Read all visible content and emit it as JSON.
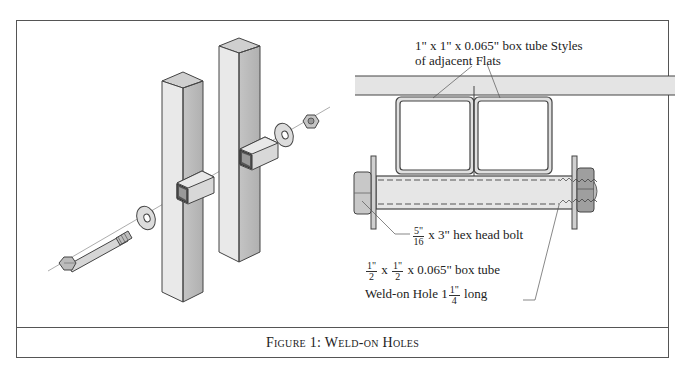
{
  "figure": {
    "caption": "Figure 1:  Weld-on Holes"
  },
  "left_illustration": {
    "description": "Exploded isometric view of two square posts joined by weld-on box tube holes with hex bolt, washers and nut",
    "parts": [
      "hex-head-bolt",
      "washer",
      "square-post",
      "weld-on-box-tube",
      "square-post",
      "weld-on-box-tube",
      "washer",
      "hex-nut"
    ]
  },
  "right_drawing": {
    "callout_top": {
      "line1": "1\" x 1\" x 0.065\" box tube Styles",
      "line2": "of adjacent Flats"
    },
    "callout_bolt": {
      "frac_num": "5\"",
      "frac_den": "16",
      "text": "x 3\" hex head bolt"
    },
    "callout_tube": {
      "a_num": "1\"",
      "a_den": "2",
      "x1": "x",
      "b_num": "1\"",
      "b_den": "2",
      "rest": "x 0.065\" box tube",
      "line2_pre": "Weld-on Hole 1",
      "len_num": "1\"",
      "len_den": "4",
      "line2_post": "long"
    }
  },
  "colors": {
    "frame": "#555555",
    "steel_light": "#e6e6e6",
    "steel_mid": "#cfcfcf",
    "steel_dark": "#a9a9a9",
    "outline": "#444444"
  }
}
